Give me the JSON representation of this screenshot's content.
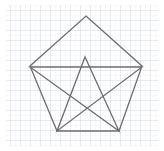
{
  "figure": {
    "background_color": "#ffffff",
    "grid": {
      "visible": true,
      "minor_color": "#e2e9f0",
      "major_color": "#c9d6e2",
      "minor_spacing": 5,
      "major_spacing": 10,
      "minor_width": 0.5,
      "major_width": 0.7,
      "area": {
        "x": 6,
        "y": 5,
        "width": 152,
        "height": 141
      }
    },
    "stroke": {
      "color": "#6e6e72",
      "width": 1.3,
      "linejoin": "miter",
      "linecap": "butt"
    },
    "shapes": [
      {
        "name": "pentagon-outline",
        "type": "polygon",
        "closed": true,
        "points": [
          {
            "label": "apex",
            "x": 86,
            "y": 16
          },
          {
            "label": "right-upper",
            "x": 142,
            "y": 66
          },
          {
            "label": "right-lower",
            "x": 119,
            "y": 131
          },
          {
            "label": "left-lower",
            "x": 57,
            "y": 131
          },
          {
            "label": "left-upper",
            "x": 30,
            "y": 66
          }
        ]
      },
      {
        "name": "pentagram-star",
        "type": "polyline-star",
        "closed": true,
        "points": [
          {
            "label": "star-apex",
            "x": 85,
            "y": 57
          },
          {
            "label": "star-right-lower",
            "x": 119,
            "y": 131
          },
          {
            "label": "star-left-upper",
            "x": 30,
            "y": 67
          },
          {
            "label": "star-right-upper",
            "x": 142,
            "y": 67
          },
          {
            "label": "star-left-lower",
            "x": 57,
            "y": 131
          }
        ]
      }
    ],
    "counts": {
      "pentagon_sides": "5",
      "star_points": "5",
      "total_vertices": "10"
    }
  }
}
